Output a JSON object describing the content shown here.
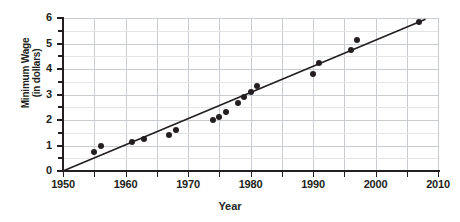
{
  "chart_data": {
    "type": "scatter",
    "title": "",
    "xlabel": "Year",
    "ylabel": "Minimum Wage (in dollars)",
    "ylabel_line1": "Minimum Wage",
    "ylabel_line2": "(in dollars)",
    "xlim": [
      1950,
      2010
    ],
    "ylim": [
      0,
      6
    ],
    "xticks": [
      1950,
      1955,
      1960,
      1965,
      1970,
      1975,
      1980,
      1985,
      1990,
      1995,
      2000,
      2005,
      2010
    ],
    "xticklabels": [
      "1950",
      "",
      "1960",
      "",
      "1970",
      "",
      "1980",
      "",
      "1990",
      "",
      "2000",
      "",
      "2010"
    ],
    "yticks": [
      0,
      0.5,
      1,
      1.5,
      2,
      2.5,
      3,
      3.5,
      4,
      4.5,
      5,
      5.5,
      6
    ],
    "yticklabels": [
      "0",
      "",
      "1",
      "",
      "2",
      "",
      "3",
      "",
      "4",
      "",
      "5",
      "",
      "6"
    ],
    "grid": true,
    "legend": "none",
    "points": [
      {
        "x": 1955,
        "y": 0.75
      },
      {
        "x": 1956,
        "y": 1.0
      },
      {
        "x": 1961,
        "y": 1.15
      },
      {
        "x": 1963,
        "y": 1.25
      },
      {
        "x": 1967,
        "y": 1.4
      },
      {
        "x": 1968,
        "y": 1.6
      },
      {
        "x": 1974,
        "y": 2.0
      },
      {
        "x": 1975,
        "y": 2.1
      },
      {
        "x": 1976,
        "y": 2.3
      },
      {
        "x": 1978,
        "y": 2.65
      },
      {
        "x": 1979,
        "y": 2.9
      },
      {
        "x": 1980,
        "y": 3.1
      },
      {
        "x": 1981,
        "y": 3.35
      },
      {
        "x": 1990,
        "y": 3.8
      },
      {
        "x": 1991,
        "y": 4.25
      },
      {
        "x": 1996,
        "y": 4.75
      },
      {
        "x": 1997,
        "y": 5.15
      },
      {
        "x": 2007,
        "y": 5.85
      }
    ],
    "trendline": {
      "x0": 1950,
      "y0": 0.0,
      "x1": 2008,
      "y1": 5.95
    }
  }
}
